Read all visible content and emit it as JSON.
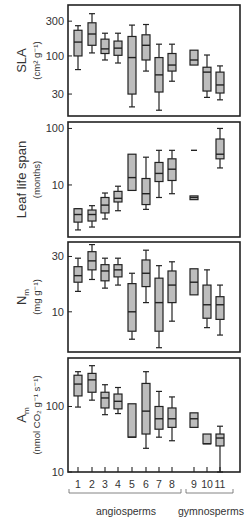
{
  "colors": {
    "box_fill": "#bdbdbd",
    "stroke": "#222222",
    "text": "#333333"
  },
  "chart_data": [
    {
      "type": "box",
      "id": "sla",
      "ylabel": "SLA",
      "yunits": "(cm² g⁻¹)",
      "yscale": "log",
      "ylim": [
        15,
        500
      ],
      "yticks": [
        30,
        100,
        300
      ],
      "ytick_labels": [
        "30",
        "100",
        "300"
      ],
      "groups": [
        {
          "group": "1",
          "whisker_low": 65,
          "q1": 100,
          "median": 155,
          "q3": 225,
          "whisker_high": 260
        },
        {
          "group": "2",
          "whisker_low": 110,
          "q1": 140,
          "median": 200,
          "q3": 285,
          "whisker_high": 380
        },
        {
          "group": "3",
          "whisker_low": 88,
          "q1": 108,
          "median": 125,
          "q3": 170,
          "whisker_high": 205
        },
        {
          "group": "4",
          "whisker_low": 80,
          "q1": 102,
          "median": 128,
          "q3": 160,
          "whisker_high": 205
        },
        {
          "group": "5",
          "whisker_low": 20,
          "q1": 30,
          "median": 95,
          "q3": 185,
          "whisker_high": 265
        },
        {
          "group": "6",
          "whisker_low": 62,
          "q1": 88,
          "median": 140,
          "q3": 195,
          "whisker_high": 270
        },
        {
          "group": "7",
          "whisker_low": 18,
          "q1": 32,
          "median": 55,
          "q3": 95,
          "whisker_high": 145
        },
        {
          "group": "8",
          "whisker_low": 45,
          "q1": 62,
          "median": 75,
          "q3": 108,
          "whisker_high": 145
        },
        {
          "group": "9",
          "whisker_low": null,
          "q1": 75,
          "median": 88,
          "q3": 120,
          "whisker_high": null
        },
        {
          "group": "10",
          "whisker_low": 27,
          "q1": 33,
          "median": 60,
          "q3": 70,
          "whisker_high": 103
        },
        {
          "group": "11",
          "whisker_low": 25,
          "q1": 31,
          "median": 40,
          "q3": 60,
          "whisker_high": 73
        }
      ]
    },
    {
      "type": "box",
      "id": "leaf_life_span",
      "ylabel": "Leaf life span",
      "yunits": "(months)",
      "yscale": "log",
      "ylim": [
        1.2,
        130
      ],
      "yticks": [
        10,
        100
      ],
      "ytick_labels": [
        "10",
        "100"
      ],
      "groups": [
        {
          "group": "1",
          "whisker_low": 1.6,
          "q1": 2.2,
          "median": 3.0,
          "q3": 3.8,
          "whisker_high": 3.8
        },
        {
          "group": "2",
          "whisker_low": 1.8,
          "q1": 2.3,
          "median": 3.0,
          "q3": 3.6,
          "whisker_high": 4.3
        },
        {
          "group": "3",
          "whisker_low": 2.5,
          "q1": 3.2,
          "median": 4.4,
          "q3": 6.0,
          "whisker_high": 7.2
        },
        {
          "group": "4",
          "whisker_low": 3.5,
          "q1": 5.0,
          "median": 5.8,
          "q3": 7.7,
          "whisker_high": 9.5
        },
        {
          "group": "5",
          "whisker_low": null,
          "q1": 8.0,
          "median": 13.5,
          "q3": 35,
          "whisker_high": null
        },
        {
          "group": "6",
          "whisker_low": 3.7,
          "q1": 4.5,
          "median": 7.0,
          "q3": 13,
          "whisker_high": 31
        },
        {
          "group": "7",
          "whisker_low": 6.0,
          "q1": 11.5,
          "median": 16,
          "q3": 25,
          "whisker_high": 41
        },
        {
          "group": "8",
          "whisker_low": 7.0,
          "q1": 12,
          "median": 19,
          "q3": 29,
          "whisker_high": 41
        },
        {
          "group": "9",
          "whisker_low": null,
          "q1": 5.5,
          "median": 6.0,
          "q3": 6.4,
          "whisker_high": null,
          "extra_marker": 41
        },
        {
          "group": "10",
          "whisker_low": null,
          "q1": null,
          "median": null,
          "q3": null,
          "whisker_high": null
        },
        {
          "group": "11",
          "whisker_low": 20,
          "q1": 29,
          "median": 35,
          "q3": 65,
          "whisker_high": 100
        }
      ]
    },
    {
      "type": "box",
      "id": "nm",
      "ylabel": "Nm",
      "ylabel_main": "N",
      "ylabel_sub": "m",
      "yunits": "(mg g⁻¹)",
      "yscale": "log",
      "ylim": [
        4.5,
        40
      ],
      "yticks": [
        10,
        30
      ],
      "ytick_labels": [
        "10",
        "30"
      ],
      "groups": [
        {
          "group": "1",
          "whisker_low": 15,
          "q1": 18,
          "median": 20.5,
          "q3": 24.5,
          "whisker_high": 29
        },
        {
          "group": "2",
          "whisker_low": 19,
          "q1": 23,
          "median": 27.5,
          "q3": 33,
          "whisker_high": 38
        },
        {
          "group": "3",
          "whisker_low": 16,
          "q1": 18.5,
          "median": 22.5,
          "q3": 25.5,
          "whisker_high": 29
        },
        {
          "group": "4",
          "whisker_low": 17,
          "q1": 20,
          "median": 23,
          "q3": 25.5,
          "whisker_high": 29
        },
        {
          "group": "5",
          "whisker_low": 5.8,
          "q1": 6.8,
          "median": 10,
          "q3": 17.5,
          "whisker_high": 21.5
        },
        {
          "group": "6",
          "whisker_low": 12,
          "q1": 16.5,
          "median": 21.5,
          "q3": 28,
          "whisker_high": 34
        },
        {
          "group": "7",
          "whisker_low": 4.9,
          "q1": 6.8,
          "median": 12,
          "q3": 19.5,
          "whisker_high": 25
        },
        {
          "group": "8",
          "whisker_low": 8.3,
          "q1": 12,
          "median": 17,
          "q3": 22.5,
          "whisker_high": 27
        },
        {
          "group": "9",
          "whisker_low": null,
          "q1": 14,
          "median": 18,
          "q3": 23.5,
          "whisker_high": null
        },
        {
          "group": "10",
          "whisker_low": 7.3,
          "q1": 8.8,
          "median": 11.5,
          "q3": 17,
          "whisker_high": 23
        },
        {
          "group": "11",
          "whisker_low": 6.3,
          "q1": 8.6,
          "median": 11.5,
          "q3": 13.5,
          "whisker_high": 17
        }
      ]
    },
    {
      "type": "box",
      "id": "am",
      "ylabel": "Am",
      "ylabel_main": "A",
      "ylabel_sub": "m",
      "yunits": "(nmol CO₂ g⁻¹ s⁻¹)",
      "yscale": "log",
      "ylim": [
        10,
        550
      ],
      "yticks": [
        10,
        100
      ],
      "ytick_labels": [
        "10",
        "100"
      ],
      "groups": [
        {
          "group": "1",
          "whisker_low": 98,
          "q1": 145,
          "median": 220,
          "q3": 300,
          "whisker_high": 340
        },
        {
          "group": "2",
          "whisker_low": 125,
          "q1": 165,
          "median": 255,
          "q3": 320,
          "whisker_high": 420
        },
        {
          "group": "3",
          "whisker_low": 75,
          "q1": 95,
          "median": 135,
          "q3": 165,
          "whisker_high": 215
        },
        {
          "group": "4",
          "whisker_low": 78,
          "q1": 92,
          "median": 120,
          "q3": 155,
          "whisker_high": 195
        },
        {
          "group": "5",
          "whisker_low": null,
          "q1": 34,
          "median": 34,
          "q3": 110,
          "whisker_high": null
        },
        {
          "group": "6",
          "whisker_low": 23,
          "q1": 38,
          "median": 85,
          "q3": 225,
          "whisker_high": 340
        },
        {
          "group": "7",
          "whisker_low": 34,
          "q1": 45,
          "median": 65,
          "q3": 100,
          "whisker_high": 170
        },
        {
          "group": "8",
          "whisker_low": 30,
          "q1": 48,
          "median": 65,
          "q3": 95,
          "whisker_high": 140
        },
        {
          "group": "9",
          "whisker_low": null,
          "q1": 48,
          "median": 65,
          "q3": 80,
          "whisker_high": null
        },
        {
          "group": "10",
          "whisker_low": null,
          "q1": 27,
          "median": 27,
          "q3": 38,
          "whisker_high": null
        },
        {
          "group": "11",
          "whisker_low": 10,
          "q1": 25,
          "median": 33,
          "q3": 38,
          "whisker_high": 50
        }
      ]
    }
  ],
  "x_axis": {
    "tick_labels": [
      "1",
      "2",
      "3",
      "4",
      "5",
      "6",
      "7",
      "8",
      "9",
      "10",
      "11"
    ],
    "group_brackets": [
      {
        "label": "angiosperms",
        "from": "1",
        "to": "8"
      },
      {
        "label": "gymnosperms",
        "from": "9",
        "to": "11"
      }
    ]
  }
}
